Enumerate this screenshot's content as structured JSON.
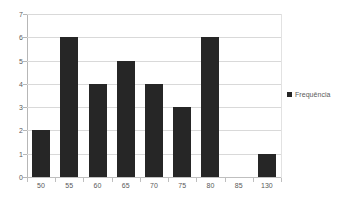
{
  "chart_data": {
    "type": "bar",
    "title": "",
    "subtitle": "",
    "xlabel": "",
    "ylabel": "",
    "categories": [
      "50",
      "55",
      "60",
      "65",
      "70",
      "75",
      "80",
      "85",
      "130"
    ],
    "values": [
      2,
      6,
      4,
      5,
      4,
      3,
      6,
      0,
      1
    ],
    "series": [
      {
        "name": "Frequência",
        "values": [
          2,
          6,
          4,
          5,
          4,
          3,
          6,
          0,
          1
        ],
        "color": "#262626"
      }
    ],
    "ylim": [
      0,
      7
    ],
    "yticks": [
      "0",
      "1",
      "2",
      "3",
      "4",
      "5",
      "6",
      "7"
    ],
    "xticks": [
      "50",
      "55",
      "60",
      "65",
      "70",
      "75",
      "80",
      "85",
      "130"
    ],
    "grid": "horizontal",
    "legend": {
      "position": "right",
      "entries": [
        {
          "label": "Frequência",
          "color": "#262626",
          "marker": "square-marker"
        }
      ]
    },
    "colors": {
      "bar": "#262626",
      "gridline": "#d9d9d9",
      "axis": "#b7b7b7",
      "tick_text": "#5a5a5a",
      "background": "#ffffff"
    }
  }
}
